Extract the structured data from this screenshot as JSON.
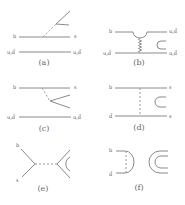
{
  "figure": {
    "panels": [
      {
        "id": "a",
        "caption": "(a)",
        "top_left": "b",
        "top_right": "s",
        "bottom_left": "u,d̄",
        "bottom_right": "u,d̄"
      },
      {
        "id": "b",
        "caption": "(b)",
        "top_left": "b",
        "top_right": "u,d̄",
        "bottom_left": "u,d̄",
        "bottom_right": "u,d̄"
      },
      {
        "id": "c",
        "caption": "(c)",
        "top_left": "b",
        "top_right": "s",
        "bottom_left": "u,d̄",
        "bottom_right": "u,d̄"
      },
      {
        "id": "d",
        "caption": "(d)",
        "top_left": "b",
        "top_right": "s",
        "bottom_left": "d̄",
        "bottom_right": "s"
      },
      {
        "id": "e",
        "caption": "(e)",
        "top_left": "b",
        "bottom_left": "s"
      },
      {
        "id": "f",
        "caption": "(f)",
        "top_left": "b",
        "bottom_left": "d̄"
      }
    ],
    "colors": {
      "line": "#8a8a8a",
      "text": "#555555"
    }
  }
}
